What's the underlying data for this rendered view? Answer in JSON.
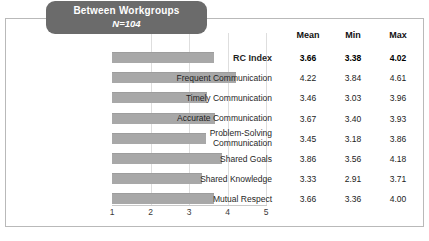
{
  "figure": {
    "title": "Between Workgroups",
    "subtitle": "N=104"
  },
  "table": {
    "headers": [
      "Mean",
      "Min",
      "Max"
    ]
  },
  "chart_data": {
    "type": "bar",
    "orientation": "horizontal",
    "title": "Between Workgroups",
    "subtitle": "N=104",
    "xlabel": "",
    "ylabel": "",
    "xlim": [
      1,
      5
    ],
    "xticks": [
      1,
      2,
      3,
      4,
      5
    ],
    "xtick_labels": [
      "1",
      "2",
      "3",
      "4",
      "5"
    ],
    "grid": "vertical-only",
    "legend": "none",
    "bar_color": "#a8a8a8",
    "categories": [
      "RC Index",
      "Frequent Communication",
      "Timely Communication",
      "Accurate Communication",
      "Problem-Solving Communication",
      "Shared Goals",
      "Shared Knowledge",
      "Mutual Respect"
    ],
    "category_lines": [
      [
        "RC Index"
      ],
      [
        "Frequent Communication"
      ],
      [
        "Timely Communication"
      ],
      [
        "Accurate Communication"
      ],
      [
        "Problem-Solving",
        "Communication"
      ],
      [
        "Shared Goals"
      ],
      [
        "Shared Knowledge"
      ],
      [
        "Mutual Respect"
      ]
    ],
    "emphasis": [
      true,
      false,
      false,
      false,
      false,
      false,
      false,
      false
    ],
    "values": [
      3.66,
      4.22,
      3.46,
      3.67,
      3.45,
      3.86,
      3.33,
      3.66
    ],
    "series": [
      {
        "name": "Mean",
        "values": [
          3.66,
          4.22,
          3.46,
          3.67,
          3.45,
          3.86,
          3.33,
          3.66
        ]
      },
      {
        "name": "Min",
        "values": [
          3.38,
          3.84,
          3.03,
          3.4,
          3.18,
          3.56,
          2.91,
          3.36
        ]
      },
      {
        "name": "Max",
        "values": [
          4.02,
          4.61,
          3.96,
          3.93,
          3.86,
          4.18,
          3.71,
          4.0
        ]
      }
    ],
    "table_rows": [
      {
        "label": "RC Index",
        "mean": "3.66",
        "min": "3.38",
        "max": "4.02",
        "bold": true
      },
      {
        "label": "Frequent Communication",
        "mean": "4.22",
        "min": "3.84",
        "max": "4.61",
        "bold": false
      },
      {
        "label": "Timely Communication",
        "mean": "3.46",
        "min": "3.03",
        "max": "3.96",
        "bold": false
      },
      {
        "label": "Accurate Communication",
        "mean": "3.67",
        "min": "3.40",
        "max": "3.93",
        "bold": false
      },
      {
        "label": "Problem-Solving Communication",
        "mean": "3.45",
        "min": "3.18",
        "max": "3.86",
        "bold": false
      },
      {
        "label": "Shared Goals",
        "mean": "3.86",
        "min": "3.56",
        "max": "4.18",
        "bold": false
      },
      {
        "label": "Shared Knowledge",
        "mean": "3.33",
        "min": "2.91",
        "max": "3.71",
        "bold": false
      },
      {
        "label": "Mutual Respect",
        "mean": "3.66",
        "min": "3.36",
        "max": "4.00",
        "bold": false
      }
    ]
  }
}
